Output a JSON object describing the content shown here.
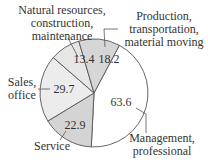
{
  "chart_data": {
    "type": "pie",
    "title": "",
    "slices": [
      {
        "label": "Management, professional",
        "value": 63.6,
        "color": "#ffffff"
      },
      {
        "label": "Service",
        "value": 22.9,
        "color": "#d4d4d4"
      },
      {
        "label": "Sales, office",
        "value": 29.7,
        "color": "#ececec"
      },
      {
        "label": "Natural resources, construction, maintenance",
        "value": 13.4,
        "color": "#e6e6e6"
      },
      {
        "label": "Production, transportation, material moving",
        "value": 18.2,
        "color": "#d6d6d6"
      }
    ],
    "start_angle_deg": 28,
    "legend": "none (callout labels)"
  },
  "labels": {
    "management": {
      "line1": "Management,",
      "line2": "professional",
      "value": "63.6"
    },
    "service": {
      "line1": "Service",
      "value": "22.9"
    },
    "sales": {
      "line1": "Sales,",
      "line2": "office",
      "value": "29.7"
    },
    "natural": {
      "line1": "Natural resources,",
      "line2": "construction,",
      "line3": "maintenance",
      "value": "13.4"
    },
    "production": {
      "line1": "Production,",
      "line2": "transportation,",
      "line3": "material moving",
      "value": "18.2"
    }
  }
}
